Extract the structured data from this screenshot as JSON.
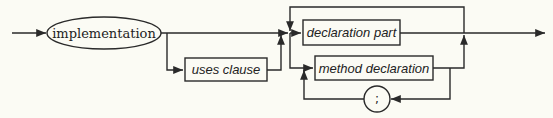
{
  "diagram": {
    "type": "syntax-diagram",
    "nodes": {
      "start": {
        "label": "implementation",
        "shape": "ellipse",
        "kind": "terminal"
      },
      "uses": {
        "label": "uses clause",
        "shape": "rectangle",
        "kind": "nonterminal"
      },
      "decl_part": {
        "label": "declaration part",
        "shape": "rectangle",
        "kind": "nonterminal"
      },
      "method_decl": {
        "label": "method declaration",
        "shape": "rectangle",
        "kind": "nonterminal"
      },
      "semicolon": {
        "label": ";",
        "shape": "circle",
        "kind": "terminal"
      }
    },
    "edges": [
      {
        "from": "entry",
        "to": "start"
      },
      {
        "from": "start",
        "to": "uses",
        "optional": true
      },
      {
        "from": "start",
        "to": "junction"
      },
      {
        "from": "uses",
        "to": "junction"
      },
      {
        "from": "junction",
        "to": "decl_part"
      },
      {
        "from": "junction",
        "to": "method_decl"
      },
      {
        "from": "method_decl",
        "to": "semicolon"
      },
      {
        "from": "semicolon",
        "to": "method_decl"
      },
      {
        "from": "decl_part",
        "to": "exit"
      },
      {
        "from": "method_decl",
        "to": "exit"
      },
      {
        "from": "exit",
        "to": "junction",
        "loop": true
      }
    ],
    "colors": {
      "stroke": "#2a2a2a",
      "background": "#fbfbf4"
    }
  }
}
